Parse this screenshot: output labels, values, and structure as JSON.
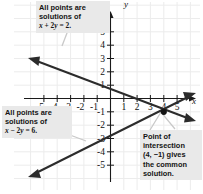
{
  "figure": {
    "type": "graph",
    "axes": {
      "x_axis_label": "x",
      "y_axis_label": "y",
      "x_ticks": [
        "-5",
        "-4",
        "-3",
        "-2",
        "-1",
        "1",
        "2",
        "3",
        "4",
        "5"
      ],
      "y_ticks_positive": [
        "5",
        "4",
        "3",
        "2",
        "1"
      ],
      "y_ticks_negative": [
        "-1",
        "-2",
        "-3",
        "-4",
        "-5"
      ],
      "xlim": [
        -6,
        6
      ],
      "ylim": [
        -6,
        6
      ],
      "grid": true
    }
  },
  "callouts": {
    "top": {
      "line1": "All points are",
      "line2": "solutions of",
      "equation_html": "<i>x</i> + 2<i>y</i> = 2."
    },
    "left": {
      "line1": "All points are",
      "line2": "solutions of",
      "equation_html": "<i>x</i> &minus; 2<i>y</i> = 6."
    },
    "right": {
      "line1": "Point of",
      "line2": "intersection",
      "line3": "(4, −1) gives",
      "line4": "the common",
      "line5": "solution."
    }
  },
  "chart_data": {
    "type": "line",
    "title": "",
    "xlabel": "x",
    "ylabel": "y",
    "xlim": [
      -6,
      6
    ],
    "ylim": [
      -6,
      6
    ],
    "grid": true,
    "series": [
      {
        "name": "x + 2y = 2",
        "equation": "x + 2y = 2",
        "slope": -0.5,
        "y_intercept": 1,
        "x_intercept": 2,
        "points": [
          [
            -6,
            4
          ],
          [
            0,
            1
          ],
          [
            2,
            0
          ],
          [
            4,
            -1
          ],
          [
            6,
            -2
          ]
        ],
        "arrows": "both"
      },
      {
        "name": "x - 2y = 6",
        "equation": "x − 2y = 6",
        "slope": 0.5,
        "y_intercept": -3,
        "x_intercept": 6,
        "points": [
          [
            -6,
            -6
          ],
          [
            0,
            -3
          ],
          [
            4,
            -1
          ],
          [
            6,
            0
          ]
        ],
        "arrows": "both"
      }
    ],
    "annotations": [
      {
        "label": "point of intersection",
        "x": 4,
        "y": -1,
        "marker": "dot"
      }
    ]
  },
  "colors": {
    "grid": "#ececec",
    "axis": "#1a1a1a",
    "line": "#2b2b2b",
    "callout_bg": "#e9e9e9",
    "leader": "#bdbdbd",
    "text": "#141414"
  }
}
